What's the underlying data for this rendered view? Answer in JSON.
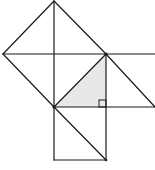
{
  "diagram": {
    "type": "geometry",
    "colors": {
      "stroke": "#1a1a1a",
      "shade": "#e8e8e8",
      "background": "#ffffff"
    },
    "points": {
      "top": [
        54,
        1
      ],
      "left": [
        3,
        54
      ],
      "center": [
        54,
        54
      ],
      "B": [
        106,
        54
      ],
      "A": [
        54,
        107
      ],
      "C": [
        106,
        107
      ],
      "right_end_upper": [
        155,
        54
      ],
      "right_end_lower": [
        155,
        107
      ],
      "bottom_left": [
        54,
        160
      ],
      "bottom_right": [
        106,
        160
      ]
    },
    "shaded_triangle": [
      [
        54,
        107
      ],
      [
        106,
        54
      ],
      [
        106,
        107
      ]
    ],
    "right_angle_at": [
      106,
      107
    ],
    "labels": []
  }
}
